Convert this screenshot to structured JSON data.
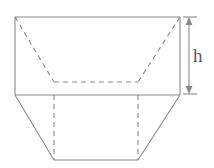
{
  "figure": {
    "kind": "geometry-diagram",
    "background_color": "#ffffff",
    "stroke_color": "#8a8a8a",
    "hidden_stroke_color": "#8a8a8a",
    "label_color": "#5a5a5a",
    "stroke_width": 1.1,
    "dash_pattern": "5 4",
    "labels": {
      "height": "h"
    },
    "geometry": {
      "top_rect": {
        "left": 15,
        "top": 17,
        "right": 180,
        "bottom": 95
      },
      "inner_top_edge": {
        "x1": 54,
        "y1": 82,
        "x2": 138,
        "y2": 82
      },
      "diagonal_left": {
        "x1": 15,
        "y1": 17,
        "x2": 54,
        "y2": 82
      },
      "diagonal_right": {
        "x1": 180,
        "y1": 17,
        "x2": 138,
        "y2": 82
      },
      "lower_trapezoid": [
        {
          "x": 15,
          "y": 95
        },
        {
          "x": 54,
          "y": 160
        },
        {
          "x": 138,
          "y": 160
        },
        {
          "x": 180,
          "y": 95
        }
      ],
      "hidden_vertical_left": {
        "x1": 54,
        "y1": 95,
        "x2": 54,
        "y2": 160
      },
      "hidden_vertical_right": {
        "x1": 138,
        "y1": 95,
        "x2": 138,
        "y2": 160
      },
      "dimension_arrow": {
        "x": 189,
        "y_top": 17,
        "y_bottom": 94,
        "tick_left": 183,
        "tick_right": 197
      },
      "label_position": {
        "x": 193,
        "y": 46
      }
    }
  }
}
